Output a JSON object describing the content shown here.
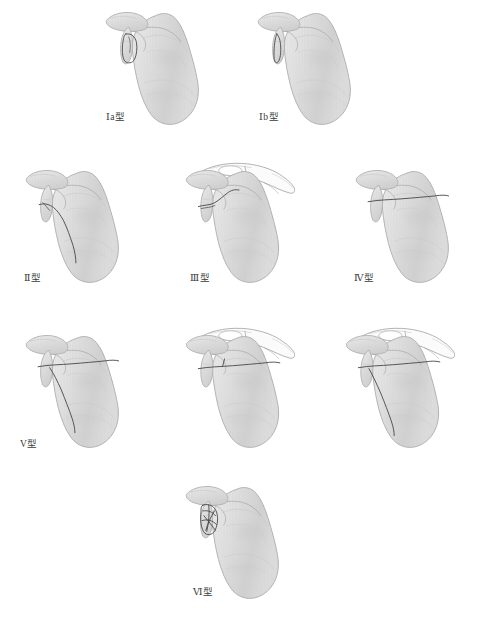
{
  "figure_title": "",
  "canvas": {
    "width": 478,
    "height": 620,
    "background": "#ffffff"
  },
  "palette": {
    "background": "#ffffff",
    "bone_fill_light": "#ededed",
    "bone_fill_mid": "#dcdcdc",
    "bone_fill_dark": "#cfcfcf",
    "bone_outline": "#a8a8a8",
    "bone_shading": "#c9c9c9",
    "clavicle_fill": "#fbfbfb",
    "fracture_line": "#4a4a4a",
    "label_text": "#3a3a3a",
    "hatch_stripe": "#d2d2d2"
  },
  "illustration": {
    "subject": "right-scapula-lateral-view",
    "style": "pencil-shaded-anatomical-line-drawing",
    "hatching": "vertical-stripes",
    "rows": [
      {
        "row": 1,
        "count": 2
      },
      {
        "row": 2,
        "count": 3
      },
      {
        "row": 3,
        "count": 3
      },
      {
        "row": 4,
        "count": 1
      }
    ]
  },
  "figures": [
    {
      "id": "type-1a",
      "label": "Ⅰa型",
      "label_visible": true,
      "row": 1,
      "column": 1,
      "x": 88,
      "y": 2,
      "width": 130,
      "height": 130,
      "label_x": 106,
      "label_y": 113,
      "has_clavicle": false,
      "fracture_pattern": "small-anterior-glenoid-rim-avulsion-fragment",
      "fracture_description": "closed loop fragment at anterior glenoid rim"
    },
    {
      "id": "type-1b",
      "label": "Ⅰb型",
      "label_visible": true,
      "row": 1,
      "column": 2,
      "x": 240,
      "y": 2,
      "width": 130,
      "height": 130,
      "label_x": 259,
      "label_y": 113,
      "has_clavicle": false,
      "fracture_pattern": "narrow-posterior-glenoid-rim-avulsion-fragment",
      "fracture_description": "thin sliver fragment along glenoid rim"
    },
    {
      "id": "type-2",
      "label": "Ⅱ型",
      "label_visible": true,
      "row": 2,
      "column": 1,
      "x": 8,
      "y": 160,
      "width": 130,
      "height": 130,
      "label_x": 24,
      "label_y": 274,
      "has_clavicle": false,
      "fracture_pattern": "transverse-glenoid-fracture-exiting-lateral-border",
      "fracture_description": "fracture through glenoid running inferolaterally to lateral border"
    },
    {
      "id": "type-3",
      "label": "Ⅲ型",
      "label_visible": true,
      "row": 2,
      "column": 2,
      "x": 172,
      "y": 160,
      "width": 138,
      "height": 130,
      "label_x": 190,
      "label_y": 274,
      "has_clavicle": true,
      "fracture_pattern": "superior-glenoid-fracture-extending-to-coracoid",
      "fracture_description": "oblique fracture exiting superiorly, clavicle and coracoid shown"
    },
    {
      "id": "type-4",
      "label": "Ⅳ型",
      "label_visible": true,
      "row": 2,
      "column": 3,
      "x": 338,
      "y": 160,
      "width": 130,
      "height": 130,
      "label_x": 354,
      "label_y": 274,
      "has_clavicle": false,
      "fracture_pattern": "transverse-fracture-exiting-medial-scapular-border",
      "fracture_description": "horizontal fracture crossing entire body to medial border"
    },
    {
      "id": "type-5",
      "label": "V型",
      "label_visible": true,
      "row": 3,
      "column": 1,
      "x": 8,
      "y": 325,
      "width": 130,
      "height": 130,
      "label_x": 20,
      "label_y": 440,
      "has_clavicle": false,
      "fracture_pattern": "type-4-plus-inferior-glenoid-separation",
      "fracture_description": "transverse fracture to medial border plus branch to lateral border"
    },
    {
      "id": "type-5b-unlabeled",
      "label": "",
      "label_visible": false,
      "row": 3,
      "column": 2,
      "x": 172,
      "y": 325,
      "width": 138,
      "height": 130,
      "label_x": 0,
      "label_y": 0,
      "has_clavicle": true,
      "fracture_pattern": "transverse-medial-exit-with-clavicle-and-coracoid",
      "fracture_description": "horizontal fracture across body, clavicle shown"
    },
    {
      "id": "type-5c-unlabeled",
      "label": "",
      "label_visible": false,
      "row": 3,
      "column": 3,
      "x": 332,
      "y": 325,
      "width": 138,
      "height": 130,
      "label_x": 0,
      "label_y": 0,
      "has_clavicle": true,
      "fracture_pattern": "transverse-plus-oblique-branch-with-clavicle",
      "fracture_description": "horizontal fracture plus inferior branch, clavicle shown"
    },
    {
      "id": "type-6",
      "label": "Ⅵ型",
      "label_visible": true,
      "row": 4,
      "column": 1,
      "x": 168,
      "y": 476,
      "width": 130,
      "height": 130,
      "label_x": 193,
      "label_y": 588,
      "has_clavicle": false,
      "fracture_pattern": "comminuted-glenoid-fracture",
      "fracture_description": "multiple intersecting fragment lines at glenoid"
    }
  ]
}
